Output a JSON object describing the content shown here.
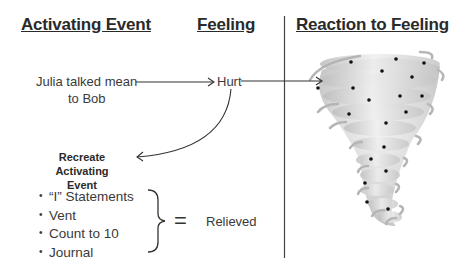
{
  "headers": {
    "activating_event": "Activating Event",
    "feeling": "Feeling",
    "reaction": "Reaction to Feeling"
  },
  "event": {
    "line1": "Julia talked mean",
    "line2": "to Bob"
  },
  "feeling": {
    "label": "Hurt"
  },
  "recreate": {
    "line1": "Recreate Activating",
    "line2": "Event"
  },
  "strategies": [
    {
      "label": "“I” Statements"
    },
    {
      "label": "Vent"
    },
    {
      "label": "Count to 10"
    },
    {
      "label": "Journal"
    }
  ],
  "bullet_glyph": "•",
  "equals": "=",
  "result": "Relieved",
  "tornado": {
    "icon": "tornado-icon",
    "dots": 19
  }
}
